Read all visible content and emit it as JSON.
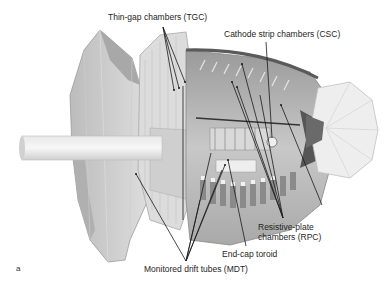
{
  "figure": {
    "panel_letter": "a",
    "labels": {
      "tgc": "Thin-gap chambers (TGC)",
      "csc": "Cathode strip chambers (CSC)",
      "rpc_line1": "Resistive-plate",
      "rpc_line2": "chambers (RPC)",
      "endcap": "End-cap toroid",
      "mdt": "Monitored drift tubes (MDT)"
    },
    "colors": {
      "background": "#ffffff",
      "leader_line": "#1a1a1a",
      "text": "#1e1e1e",
      "detector_light": "#e6e6e6",
      "detector_mid": "#bdbdbd",
      "detector_dark": "#7a7a7a"
    }
  }
}
